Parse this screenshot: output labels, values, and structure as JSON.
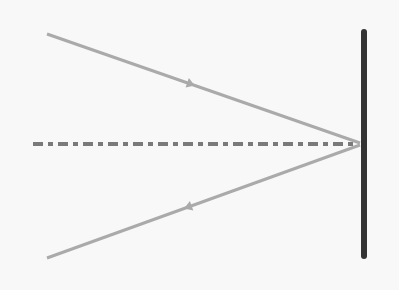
{
  "diagram": {
    "background": "#f8f8f8",
    "mirror": {
      "x": 364,
      "y1": 32,
      "y2": 256,
      "color": "#333333",
      "width": 6
    },
    "normal": {
      "x1": 33,
      "y1": 144,
      "x2": 358,
      "y2": 144,
      "color": "#7a7a7a",
      "width": 4,
      "dash": "10 5 5 5"
    },
    "incident_ray": {
      "x1": 47,
      "y1": 34,
      "x2": 360,
      "y2": 143,
      "color": "#aaaaaa",
      "width": 3,
      "arrow_at": 0.46
    },
    "reflected_ray": {
      "x1": 360,
      "y1": 145,
      "x2": 47,
      "y2": 258,
      "color": "#aaaaaa",
      "width": 3,
      "arrow_at": 0.55
    }
  }
}
